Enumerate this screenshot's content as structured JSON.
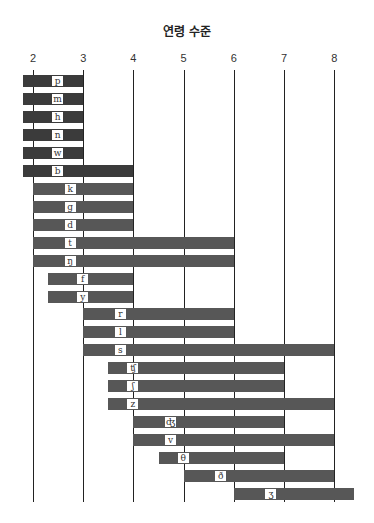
{
  "chart_data": {
    "type": "bar",
    "orientation": "horizontal-range",
    "title": "연령 수준",
    "xlabel": "",
    "ylabel": "",
    "xlim": [
      2,
      8
    ],
    "x_ticks": [
      2,
      3,
      4,
      5,
      6,
      7,
      8
    ],
    "grid": true,
    "legend": null,
    "categories": [
      "p",
      "m",
      "h",
      "n",
      "w",
      "b",
      "k",
      "g",
      "d",
      "t",
      "ŋ",
      "f",
      "y",
      "r",
      "l",
      "s",
      "ʧ",
      "ʃ",
      "z",
      "ʤ",
      "v",
      "θ",
      "ð",
      "ʒ"
    ],
    "ranges": [
      {
        "label": "p",
        "start": 1.8,
        "end": 3.0,
        "label_at": 2.5,
        "shade": "dark"
      },
      {
        "label": "m",
        "start": 1.8,
        "end": 3.0,
        "label_at": 2.5,
        "shade": "dark"
      },
      {
        "label": "h",
        "start": 1.8,
        "end": 3.0,
        "label_at": 2.5,
        "shade": "dark"
      },
      {
        "label": "n",
        "start": 1.8,
        "end": 3.0,
        "label_at": 2.5,
        "shade": "dark"
      },
      {
        "label": "w",
        "start": 1.8,
        "end": 3.0,
        "label_at": 2.5,
        "shade": "dark"
      },
      {
        "label": "b",
        "start": 1.8,
        "end": 4.0,
        "label_at": 2.5,
        "shade": "dark"
      },
      {
        "label": "k",
        "start": 2.0,
        "end": 4.0,
        "label_at": 2.75,
        "shade": "mid"
      },
      {
        "label": "g",
        "start": 2.0,
        "end": 4.0,
        "label_at": 2.75,
        "shade": "mid"
      },
      {
        "label": "d",
        "start": 2.0,
        "end": 4.0,
        "label_at": 2.75,
        "shade": "mid"
      },
      {
        "label": "t",
        "start": 2.0,
        "end": 6.0,
        "label_at": 2.75,
        "shade": "mid"
      },
      {
        "label": "ŋ",
        "start": 2.0,
        "end": 6.0,
        "label_at": 2.75,
        "shade": "mid"
      },
      {
        "label": "f",
        "start": 2.3,
        "end": 4.0,
        "label_at": 3.0,
        "shade": "mid"
      },
      {
        "label": "y",
        "start": 2.3,
        "end": 4.0,
        "label_at": 3.0,
        "shade": "mid"
      },
      {
        "label": "r",
        "start": 3.0,
        "end": 6.0,
        "label_at": 3.75,
        "shade": "mid"
      },
      {
        "label": "l",
        "start": 3.0,
        "end": 6.0,
        "label_at": 3.75,
        "shade": "mid"
      },
      {
        "label": "s",
        "start": 3.0,
        "end": 8.0,
        "label_at": 3.75,
        "shade": "mid"
      },
      {
        "label": "ʧ",
        "start": 3.5,
        "end": 7.0,
        "label_at": 4.0,
        "shade": "mid"
      },
      {
        "label": "ʃ",
        "start": 3.5,
        "end": 7.0,
        "label_at": 4.0,
        "shade": "mid"
      },
      {
        "label": "z",
        "start": 3.5,
        "end": 8.0,
        "label_at": 4.0,
        "shade": "mid"
      },
      {
        "label": "ʤ",
        "start": 4.0,
        "end": 7.0,
        "label_at": 4.75,
        "shade": "mid"
      },
      {
        "label": "v",
        "start": 4.0,
        "end": 8.0,
        "label_at": 4.75,
        "shade": "mid"
      },
      {
        "label": "θ",
        "start": 4.5,
        "end": 7.0,
        "label_at": 5.0,
        "shade": "mid"
      },
      {
        "label": "ð",
        "start": 5.0,
        "end": 8.0,
        "label_at": 5.75,
        "shade": "mid"
      },
      {
        "label": "ʒ",
        "start": 6.0,
        "end": 8.4,
        "label_at": 6.75,
        "shade": "mid"
      }
    ]
  },
  "colors": {
    "bar_dark": "#3b3b3b",
    "bar_mid": "#575757",
    "gridline": "#222222",
    "label_bg": "#ffffff"
  }
}
